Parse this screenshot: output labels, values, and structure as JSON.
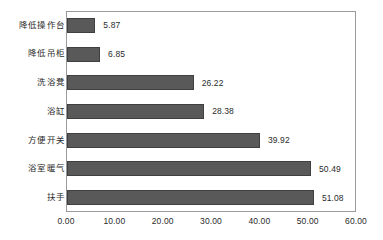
{
  "chart_data": {
    "type": "bar",
    "orientation": "horizontal",
    "title": "",
    "xlabel": "",
    "ylabel": "",
    "categories": [
      "降低操作台",
      "降低吊柜",
      "洗浴凳",
      "浴缸",
      "方便开关",
      "浴室暖气",
      "扶手"
    ],
    "values": [
      5.87,
      6.85,
      26.22,
      28.38,
      39.92,
      50.49,
      51.08
    ],
    "value_labels": [
      "5.87",
      "6.85",
      "26.22",
      "28.38",
      "39.92",
      "50.49",
      "51.08"
    ],
    "xlim": [
      0,
      60
    ],
    "xticks": [
      0,
      10,
      20,
      30,
      40,
      50,
      60
    ],
    "xtick_labels": [
      "0.00",
      "10.00",
      "20.00",
      "30.00",
      "40.00",
      "50.00",
      "60.00"
    ],
    "grid": false,
    "legend": false,
    "bar_color": "#595959",
    "bar_border_color": "#3f3f3f",
    "frame_color": "#9a9a9a",
    "background": "#ffffff",
    "text_color": "#2b2b2b"
  }
}
